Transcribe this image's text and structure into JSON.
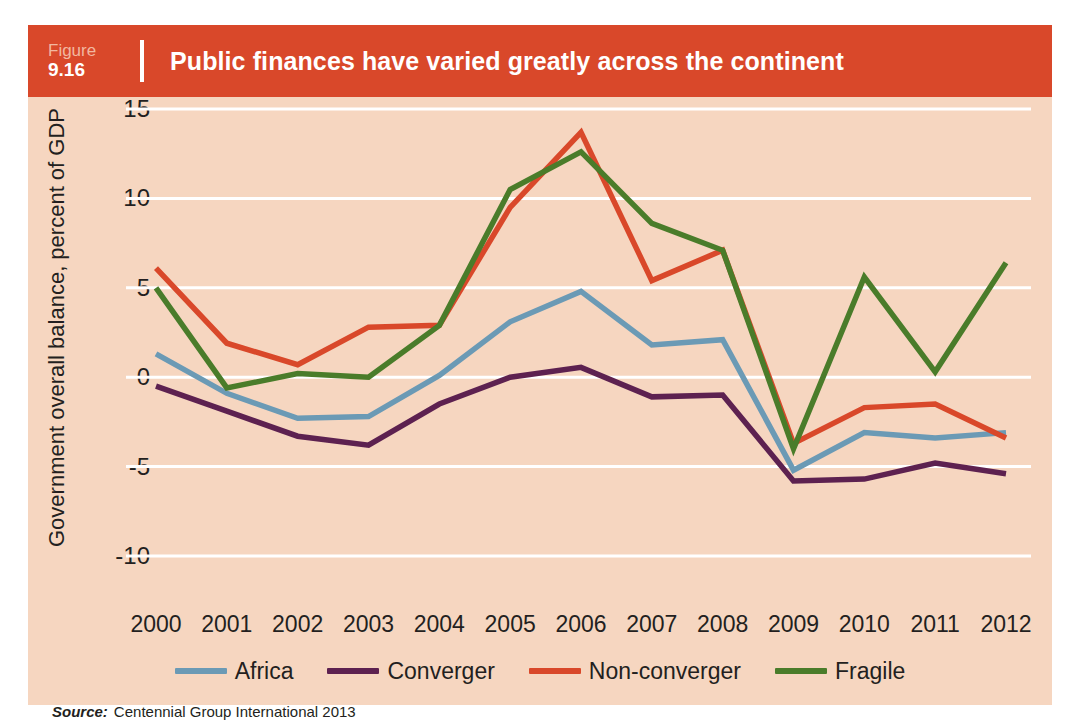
{
  "figure": {
    "word": "Figure",
    "number": "9.16",
    "title": "Public finances have varied greatly across the continent"
  },
  "source": {
    "label": "Source:",
    "text": "Centennial Group International 2013"
  },
  "colors": {
    "header_bg": "#d9482a",
    "panel_bg": "#f6d6c0",
    "gridline": "#ffffff",
    "text": "#231f20",
    "africa": "#6b9ab5",
    "converger": "#5d2150",
    "non_converger": "#d9482a",
    "fragile": "#4a7c2a"
  },
  "legend": {
    "position": "bottom",
    "items": [
      {
        "label": "Africa",
        "color": "#6b9ab5"
      },
      {
        "label": "Converger",
        "color": "#5d2150"
      },
      {
        "label": "Non-converger",
        "color": "#d9482a"
      },
      {
        "label": "Fragile",
        "color": "#4a7c2a"
      }
    ]
  },
  "chart_data": {
    "type": "line",
    "title": "Public finances have varied greatly across the continent",
    "xlabel": "",
    "ylabel": "Government overall balance, percent of GDP",
    "ylim": [
      -10,
      15
    ],
    "yticks": [
      15,
      10,
      5,
      0,
      -5,
      -10
    ],
    "ytick_labels": [
      "15",
      "10",
      "5",
      "0",
      "-5",
      "-10"
    ],
    "grid": true,
    "grid_axis": "y",
    "legend_position": "bottom",
    "x": [
      2000,
      2001,
      2002,
      2003,
      2004,
      2005,
      2006,
      2007,
      2008,
      2009,
      2010,
      2011,
      2012
    ],
    "categories": [
      "2000",
      "2001",
      "2002",
      "2003",
      "2004",
      "2005",
      "2006",
      "2007",
      "2008",
      "2009",
      "2010",
      "2011",
      "2012"
    ],
    "series": [
      {
        "name": "Africa",
        "color": "#6b9ab5",
        "values": [
          1.3,
          -0.9,
          -2.3,
          -2.2,
          0.1,
          3.1,
          4.8,
          1.8,
          2.1,
          -5.2,
          -3.1,
          -3.4,
          -3.1
        ]
      },
      {
        "name": "Converger",
        "color": "#5d2150",
        "values": [
          -0.5,
          -1.9,
          -3.3,
          -3.8,
          -1.5,
          0.0,
          0.55,
          -1.1,
          -1.0,
          -5.8,
          -5.7,
          -4.8,
          -5.4
        ]
      },
      {
        "name": "Non-converger",
        "color": "#d9482a",
        "values": [
          6.1,
          1.9,
          0.7,
          2.8,
          2.9,
          9.5,
          13.7,
          5.4,
          7.1,
          -3.7,
          -1.7,
          -1.5,
          -3.4
        ]
      },
      {
        "name": "Fragile",
        "color": "#4a7c2a",
        "values": [
          5.0,
          -0.6,
          0.2,
          0.0,
          2.9,
          10.5,
          12.6,
          8.6,
          7.1,
          -4.0,
          5.6,
          0.3,
          6.4
        ]
      }
    ]
  }
}
